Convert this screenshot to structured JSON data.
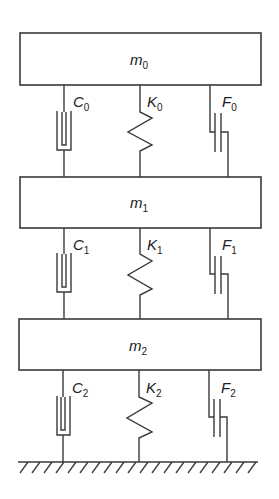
{
  "diagram": {
    "type": "three-mass spring-damper-friction system",
    "colors": {
      "line": "#3a3a3a",
      "text": "#222222",
      "background": "#ffffff"
    },
    "masses": [
      {
        "symbol": "m",
        "sub": "0"
      },
      {
        "symbol": "m",
        "sub": "1"
      },
      {
        "symbol": "m",
        "sub": "2"
      }
    ],
    "levels": [
      {
        "damper": {
          "symbol": "C",
          "sub": "0"
        },
        "spring": {
          "symbol": "K",
          "sub": "0"
        },
        "friction": {
          "symbol": "F",
          "sub": "0"
        }
      },
      {
        "damper": {
          "symbol": "C",
          "sub": "1"
        },
        "spring": {
          "symbol": "K",
          "sub": "1"
        },
        "friction": {
          "symbol": "F",
          "sub": "1"
        }
      },
      {
        "damper": {
          "symbol": "C",
          "sub": "2"
        },
        "spring": {
          "symbol": "K",
          "sub": "2"
        },
        "friction": {
          "symbol": "F",
          "sub": "2"
        }
      }
    ],
    "ground": {
      "icon": "ground-hatch-icon"
    }
  }
}
